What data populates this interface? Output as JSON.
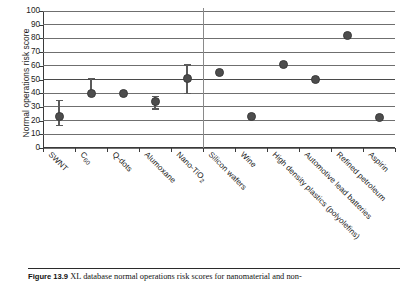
{
  "figure": {
    "caption_number": "Figure 13.9",
    "caption_text": "XL database normal operations risk scores for nanomaterial and non-"
  },
  "chart_data": {
    "type": "scatter",
    "title": "",
    "xlabel": "",
    "ylabel": "Normal operations risk score",
    "ylim": [
      0,
      100
    ],
    "ytick_step": 10,
    "yticks": [
      "100",
      "90",
      "80",
      "70",
      "60",
      "50",
      "40",
      "30",
      "20",
      "10",
      "0"
    ],
    "grid": true,
    "legend": "none",
    "group_divider_after_index": 4,
    "categories": [
      "SWNT",
      "C60",
      "Q-dots",
      "Alumoxane",
      "Nano-TiO2",
      "Silicon wafers",
      "Wine",
      "High density plastics (polyolefins)",
      "Automotive lead batteries",
      "Refined petroleum",
      "Aspirin"
    ],
    "category_labels_html": [
      "SWNT",
      "C<sub>60</sub>",
      "Q-dots",
      "Alumoxane",
      "Nano-TiO<sub>2</sub>",
      "Silicon wafers",
      "Wine",
      "High density plastics (polyolefins)",
      "Automotive lead batteries",
      "Refined petroleum",
      "Aspirin"
    ],
    "values": [
      23,
      40,
      39.5,
      34,
      51,
      55,
      23,
      61,
      50,
      82,
      22
    ],
    "err_low": [
      17,
      40,
      null,
      29,
      40,
      null,
      null,
      null,
      null,
      null,
      null
    ],
    "err_high": [
      35,
      51,
      null,
      38,
      61,
      null,
      null,
      null,
      null,
      null,
      null
    ],
    "marker_color": "#4d4d4d",
    "gridline_color": "#6f6f6f",
    "axis_color": "#3a3a3a"
  }
}
